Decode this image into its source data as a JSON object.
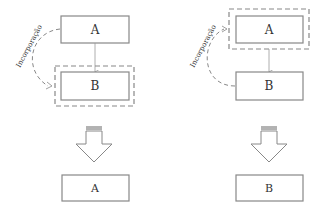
{
  "left_panel": {
    "top_box": "A",
    "bottom_box": "B",
    "edge_label": "Incorporação",
    "result_box": "A"
  },
  "right_panel": {
    "top_box": "A",
    "bottom_box": "B",
    "edge_label": "Incorporação",
    "result_box": "B"
  },
  "colors": {
    "stroke": "#888888",
    "dash": "#888888",
    "text": "#333333"
  }
}
